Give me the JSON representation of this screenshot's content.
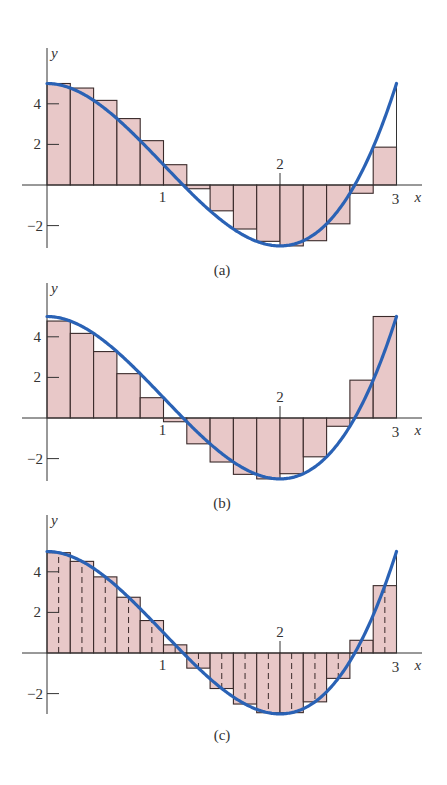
{
  "chart_data": [
    {
      "type": "bar",
      "title": "(a)",
      "subtitle": "Left-endpoint Riemann sum, n = 15",
      "function": "f(x) = 2x^3 - 6x^2 + 5",
      "xlabel": "x",
      "ylabel": "y",
      "xlim": [
        0,
        3
      ],
      "ylim": [
        -3,
        5
      ],
      "x_ticks": [
        1,
        2,
        3
      ],
      "y_ticks": [
        -2,
        2,
        4
      ],
      "grid": false,
      "bar_width": 0.2,
      "x": [
        0,
        0.2,
        0.4,
        0.6,
        0.8,
        1.0,
        1.2,
        1.4,
        1.6,
        1.8,
        2.0,
        2.2,
        2.4,
        2.6,
        2.8
      ],
      "values": [
        5,
        4.776,
        4.168,
        3.272,
        2.184,
        1,
        -0.184,
        -1.272,
        -2.168,
        -2.776,
        -3,
        -2.744,
        -1.912,
        -0.408,
        1.864
      ],
      "sample_point": "left",
      "dashed_midlines": false
    },
    {
      "type": "bar",
      "title": "(b)",
      "subtitle": "Right-endpoint Riemann sum, n = 15",
      "function": "f(x) = 2x^3 - 6x^2 + 5",
      "xlabel": "x",
      "ylabel": "y",
      "xlim": [
        0,
        3
      ],
      "ylim": [
        -3,
        5
      ],
      "x_ticks": [
        1,
        2,
        3
      ],
      "y_ticks": [
        -2,
        2,
        4
      ],
      "grid": false,
      "bar_width": 0.2,
      "x": [
        0,
        0.2,
        0.4,
        0.6,
        0.8,
        1.0,
        1.2,
        1.4,
        1.6,
        1.8,
        2.0,
        2.2,
        2.4,
        2.6,
        2.8
      ],
      "values": [
        4.776,
        4.168,
        3.272,
        2.184,
        1,
        -0.184,
        -1.272,
        -2.168,
        -2.776,
        -3,
        -2.744,
        -1.912,
        -0.408,
        1.864,
        5
      ],
      "sample_point": "right",
      "dashed_midlines": false
    },
    {
      "type": "bar",
      "title": "(c)",
      "subtitle": "Midpoint Riemann sum, n = 15",
      "function": "f(x) = 2x^3 - 6x^2 + 5",
      "xlabel": "x",
      "ylabel": "y",
      "xlim": [
        0,
        3
      ],
      "ylim": [
        -3,
        5
      ],
      "x_ticks": [
        1,
        2,
        3
      ],
      "y_ticks": [
        -2,
        2,
        4
      ],
      "grid": false,
      "bar_width": 0.2,
      "x": [
        0,
        0.2,
        0.4,
        0.6,
        0.8,
        1.0,
        1.2,
        1.4,
        1.6,
        1.8,
        2.0,
        2.2,
        2.4,
        2.6,
        2.8
      ],
      "values": [
        4.942,
        4.514,
        3.75,
        2.746,
        1.598,
        0.402,
        -0.746,
        -1.75,
        -2.514,
        -2.942,
        -2.938,
        -2.406,
        -1.25,
        0.626,
        3.318
      ],
      "sample_point": "midpoint",
      "dashed_midlines": true
    }
  ],
  "panels": [
    {
      "caption": "(a)",
      "ylabel": "y",
      "xlabel": "x",
      "tick_x": [
        "1",
        "2",
        "3"
      ],
      "tick_y": [
        "4",
        "2",
        "−2"
      ]
    },
    {
      "caption": "(b)",
      "ylabel": "y",
      "xlabel": "x",
      "tick_x": [
        "1",
        "2",
        "3"
      ],
      "tick_y": [
        "4",
        "2",
        "−2"
      ]
    },
    {
      "caption": "(c)",
      "ylabel": "y",
      "xlabel": "x",
      "tick_x": [
        "1",
        "2",
        "3"
      ],
      "tick_y": [
        "4",
        "2",
        "−2"
      ]
    }
  ],
  "colors": {
    "bar_fill": "#e8c8c8",
    "bar_stroke": "#3a2a2a",
    "curve": "#2a62b5",
    "axis": "#333333"
  }
}
